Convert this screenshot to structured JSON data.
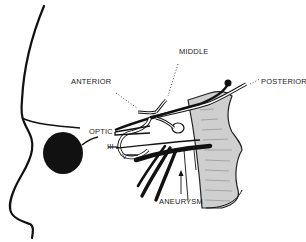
{
  "diagram": {
    "labels": {
      "anterior": "ANTERIOR",
      "middle": "MIDDLE",
      "posterior": "POSTERIOR",
      "optic": "OPTIC",
      "nerve_iii": "III",
      "nerve_v": "V",
      "aneurysm": "ANEURYSM"
    },
    "colors": {
      "ink": "#111111",
      "shading": "#c8c8c8",
      "background": "#ffffff"
    }
  }
}
